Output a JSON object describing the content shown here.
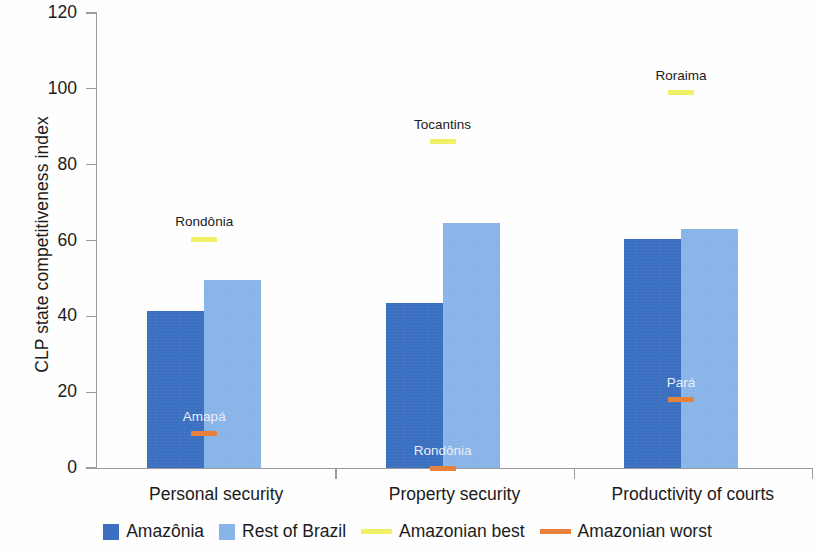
{
  "chart_data": {
    "type": "bar",
    "title": "",
    "xlabel": "",
    "ylabel": "CLP state competitiveness index",
    "ylim": [
      0,
      120
    ],
    "yticks": [
      0,
      20,
      40,
      60,
      80,
      100,
      120
    ],
    "grid": false,
    "legend_position": "bottom",
    "categories": [
      "Personal security",
      "Property security",
      "Productivity of courts"
    ],
    "series": [
      {
        "name": "Amazônia",
        "color": "#3b6fc0",
        "values": [
          41.5,
          43.5,
          60.3
        ]
      },
      {
        "name": "Rest of Brazil",
        "color": "#89b4e8",
        "values": [
          49.5,
          64.5,
          63.0
        ]
      }
    ],
    "markers": [
      {
        "kind": "best",
        "name": "Amazonian best",
        "color": "#eff064",
        "label": "Rondônia",
        "category": "Personal security",
        "value": 60.3
      },
      {
        "kind": "best",
        "name": "Amazonian best",
        "color": "#eff064",
        "label": "Tocantins",
        "category": "Property security",
        "value": 86.0
      },
      {
        "kind": "best",
        "name": "Amazonian best",
        "color": "#eff064",
        "label": "Roraima",
        "category": "Productivity of courts",
        "value": 99.0
      },
      {
        "kind": "worst",
        "name": "Amazonian worst",
        "color": "#e8813b",
        "label": "Amapá",
        "category": "Personal security",
        "value": 9.0
      },
      {
        "kind": "worst",
        "name": "Amazonian worst",
        "color": "#e8813b",
        "label": "Rondônia",
        "category": "Property security",
        "value": 0.0
      },
      {
        "kind": "worst",
        "name": "Amazonian worst",
        "color": "#e8813b",
        "label": "Pará",
        "category": "Productivity of courts",
        "value": 18.0
      }
    ],
    "legend": [
      {
        "label": "Amazônia",
        "type": "box",
        "color": "#3b6fc0"
      },
      {
        "label": "Rest of Brazil",
        "type": "box",
        "color": "#89b4e8"
      },
      {
        "label": "Amazonian best",
        "type": "line",
        "color": "#eff064"
      },
      {
        "label": "Amazonian worst",
        "type": "line",
        "color": "#e8813b"
      }
    ]
  }
}
